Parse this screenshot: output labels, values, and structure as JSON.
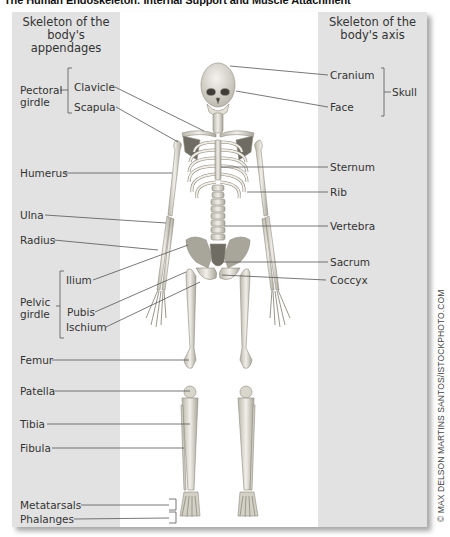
{
  "title": "The Human Endoskeleton: Internal Support and Muscle Attachment",
  "panels": {
    "left": {
      "title_line1": "Skeleton of the",
      "title_line2": "body's appendages"
    },
    "right": {
      "title_line1": "Skeleton of the",
      "title_line2": "body's axis"
    }
  },
  "groups": {
    "pectoral_girdle": {
      "line1": "Pectoral",
      "line2": "girdle"
    },
    "pelvic_girdle": {
      "line1": "Pelvic",
      "line2": "girdle"
    },
    "skull": "Skull"
  },
  "labels_left": [
    {
      "id": "clavicle",
      "text": "Clavicle"
    },
    {
      "id": "scapula",
      "text": "Scapula"
    },
    {
      "id": "humerus",
      "text": "Humerus"
    },
    {
      "id": "ulna",
      "text": "Ulna"
    },
    {
      "id": "radius",
      "text": "Radius"
    },
    {
      "id": "ilium",
      "text": "Ilium"
    },
    {
      "id": "pubis",
      "text": "Pubis"
    },
    {
      "id": "ischium",
      "text": "Ischium"
    },
    {
      "id": "femur",
      "text": "Femur"
    },
    {
      "id": "patella",
      "text": "Patella"
    },
    {
      "id": "tibia",
      "text": "Tibia"
    },
    {
      "id": "fibula",
      "text": "Fibula"
    },
    {
      "id": "metatarsals",
      "text": "Metatarsals"
    },
    {
      "id": "phalanges",
      "text": "Phalanges"
    }
  ],
  "labels_right": [
    {
      "id": "cranium",
      "text": "Cranium"
    },
    {
      "id": "face",
      "text": "Face"
    },
    {
      "id": "sternum",
      "text": "Sternum"
    },
    {
      "id": "rib",
      "text": "Rib"
    },
    {
      "id": "vertebra",
      "text": "Vertebra"
    },
    {
      "id": "sacrum",
      "text": "Sacrum"
    },
    {
      "id": "coccyx",
      "text": "Coccyx"
    }
  ],
  "credit": "© MAX DELSON MARTINS SANTOS/ISTOCKPHOTO.COM",
  "colors": {
    "panel": "#e2e2e2",
    "leader_line": "#555555",
    "bone": "#e9e6dc",
    "bone_shade": "#9a978c"
  }
}
